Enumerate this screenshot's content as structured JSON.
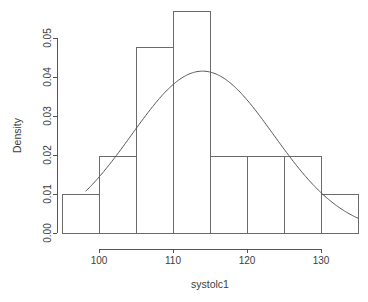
{
  "chart_data": {
    "type": "bar",
    "title": "",
    "subtitle": "",
    "xlabel": "systolc1",
    "ylabel": "Density",
    "xlim": [
      95,
      135
    ],
    "ylim": [
      0.0,
      0.0567
    ],
    "grid": false,
    "legend": null,
    "categories": [
      "95-100",
      "100-105",
      "105-110",
      "110-115",
      "115-120",
      "120-125",
      "125-130",
      "130-135"
    ],
    "bin_edges": [
      95,
      100,
      105,
      110,
      115,
      120,
      125,
      130,
      135
    ],
    "values": [
      0.0098,
      0.0195,
      0.0476,
      0.0567,
      0.0195,
      0.0195,
      0.0195,
      0.0098
    ],
    "series": [
      {
        "name": "Density",
        "type": "bar",
        "values": [
          0.0098,
          0.0195,
          0.0476,
          0.0567,
          0.0195,
          0.0195,
          0.0195,
          0.0098
        ]
      },
      {
        "name": "Normal curve",
        "type": "line",
        "mean": 114.0,
        "sd": 9.6,
        "peak_x": 114.0,
        "peak_y": 0.0415,
        "x_start": 98.2,
        "x_end": 135.0,
        "y_start": 0.0098,
        "y_end": 0.0043
      }
    ],
    "xticks": [
      100,
      110,
      120,
      130
    ],
    "xtick_labels": [
      "100",
      "110",
      "120",
      "130"
    ],
    "yticks": [
      0.0,
      0.01,
      0.02,
      0.03,
      0.04,
      0.05
    ],
    "ytick_labels": [
      "0.00",
      "0.01",
      "0.02",
      "0.03",
      "0.04",
      "0.05"
    ]
  },
  "style": {
    "background": "#ffffff",
    "line_color": "#555555",
    "bar_stroke": "#6b6b6b",
    "bar_fill": "none",
    "text_color": "#3c3c3c"
  }
}
